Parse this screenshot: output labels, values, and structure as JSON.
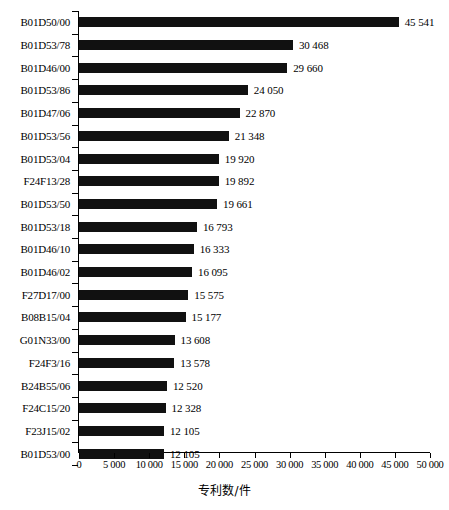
{
  "chart_data": {
    "type": "bar",
    "orientation": "horizontal",
    "title": "",
    "xlabel": "专利数/件",
    "ylabel": "",
    "xlim": [
      0,
      50000
    ],
    "xticks": [
      0,
      5000,
      10000,
      15000,
      20000,
      25000,
      30000,
      35000,
      40000,
      45000,
      50000
    ],
    "xtick_labels": [
      "0",
      "5 000",
      "10 000",
      "15 000",
      "20 000",
      "25 000",
      "30 000",
      "35 000",
      "40 000",
      "45 000",
      "50 000"
    ],
    "grid": false,
    "legend": false,
    "bar_color": "#111111",
    "categories": [
      "B01D50/00",
      "B01D53/78",
      "B01D46/00",
      "B01D53/86",
      "B01D47/06",
      "B01D53/56",
      "B01D53/04",
      "F24F13/28",
      "B01D53/50",
      "B01D53/18",
      "B01D46/10",
      "B01D46/02",
      "F27D17/00",
      "B08B15/04",
      "G01N33/00",
      "F24F3/16",
      "B24B55/06",
      "F24C15/20",
      "F23J15/02",
      "B01D53/00"
    ],
    "values": [
      45541,
      30468,
      29660,
      24050,
      22870,
      21348,
      19920,
      19892,
      19661,
      16793,
      16333,
      16095,
      15575,
      15177,
      13608,
      13578,
      12520,
      12328,
      12105,
      12105
    ],
    "value_labels": [
      "45 541",
      "30 468",
      "29 660",
      "24 050",
      "22 870",
      "21 348",
      "19 920",
      "19 892",
      "19 661",
      "16 793",
      "16 333",
      "16 095",
      "15 575",
      "15 177",
      "13 608",
      "13 578",
      "12 520",
      "12 328",
      "12 105",
      "12 105"
    ]
  }
}
